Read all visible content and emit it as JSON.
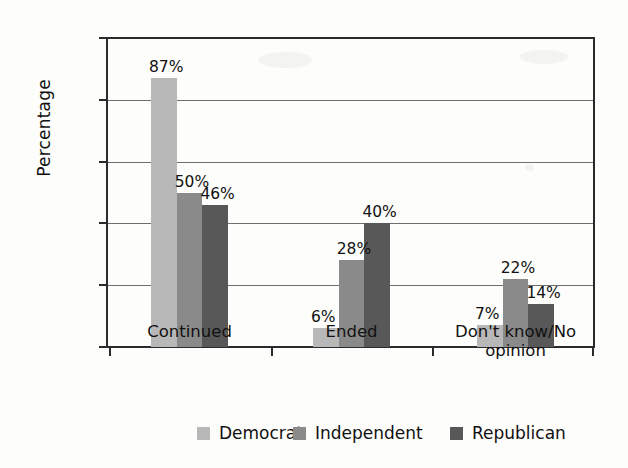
{
  "chart_data": {
    "type": "bar",
    "title": "",
    "subtitle": "",
    "xlabel": "",
    "ylabel": "Percentage",
    "ylim": [
      0,
      100
    ],
    "yticks": [
      0,
      20,
      40,
      60,
      80,
      100
    ],
    "ytick_labels": [
      "0",
      "20",
      "40",
      "60",
      "80",
      "100"
    ],
    "grid": true,
    "legend_position": "bottom",
    "categories": [
      "Continued",
      "Ended",
      "Don't know/No opinion"
    ],
    "category_lines": [
      [
        "Continued"
      ],
      [
        "Ended"
      ],
      [
        "Don't know/No",
        "opinion"
      ]
    ],
    "series": [
      {
        "name": "Democrat",
        "color": "#b8b8b8",
        "values": [
          87,
          6,
          7
        ],
        "value_labels": [
          "87%",
          "6%",
          "7%"
        ]
      },
      {
        "name": "Independent",
        "color": "#8a8a8a",
        "values": [
          50,
          28,
          22
        ],
        "value_labels": [
          "50%",
          "28%",
          "22%"
        ]
      },
      {
        "name": "Republican",
        "color": "#585858",
        "values": [
          46,
          40,
          14
        ],
        "value_labels": [
          "46%",
          "40%",
          "14%"
        ]
      }
    ]
  },
  "legend": {
    "items": [
      {
        "label": "Democrat",
        "color": "#b8b8b8"
      },
      {
        "label": "Independent",
        "color": "#8a8a8a"
      },
      {
        "label": "Republican",
        "color": "#585858"
      }
    ]
  },
  "axis": {
    "y_title": "Percentage"
  }
}
